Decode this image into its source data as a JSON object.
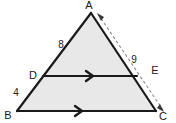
{
  "figure": {
    "title": "Triangle ABC with segment DE parallel to BC",
    "background_color": "#ffffff",
    "fill_color": "#e8e8e8",
    "stroke_color": "#1a1a1a",
    "dash_color": "#8a8a8a"
  },
  "vertices": {
    "a": {
      "label": "A",
      "x": 91,
      "y": 13,
      "label_x": 89,
      "label_y": 9
    },
    "b": {
      "label": "B",
      "x": 17,
      "y": 111,
      "label_x": 8,
      "label_y": 117
    },
    "c": {
      "label": "C",
      "x": 156,
      "y": 111,
      "label_x": 160,
      "label_y": 119
    },
    "d": {
      "label": "D",
      "x": 43,
      "y": 76,
      "label_x": 31,
      "label_y": 76
    },
    "e": {
      "label": "E",
      "x": 137,
      "y": 76,
      "label_x": 154,
      "label_y": 72
    }
  },
  "measures": {
    "ad": {
      "label": "8",
      "x": 61,
      "y": 45
    },
    "db": {
      "label": "4",
      "x": 17,
      "y": 93
    },
    "ae": {
      "label": "9",
      "x": 134,
      "y": 60
    }
  },
  "markers": {
    "de_parallel": {
      "name": "single-chevron",
      "x": 91,
      "y": 76
    },
    "bc_parallel": {
      "name": "single-chevron",
      "x": 80,
      "y": 111
    }
  },
  "annotation": {
    "name": "dashed-double-arrow-AC",
    "from": "A",
    "to": "C",
    "style": "dashed"
  }
}
